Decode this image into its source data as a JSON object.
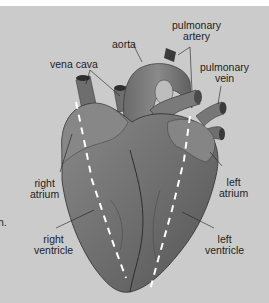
{
  "diagram": {
    "labels": {
      "vena_cava": "vena cava",
      "aorta": "aorta",
      "pulmonary_artery": [
        "pulmonary",
        "artery"
      ],
      "pulmonary_vein": [
        "pulmonary",
        "vein"
      ],
      "right_atrium": [
        "right",
        "atrium"
      ],
      "left_atrium": [
        "left",
        "atrium"
      ],
      "right_ventricle": [
        "right",
        "ventricle"
      ],
      "left_ventricle": [
        "left",
        "ventricle"
      ]
    },
    "edge_fragment": "n.",
    "colors": {
      "background": "#cbcbcb",
      "heart_dark": "#5a5a5a",
      "heart_mid": "#7a7a7a",
      "heart_light": "#9a9a9a",
      "dashed_line": "#ffffff",
      "text": "#1e1e1e"
    }
  }
}
